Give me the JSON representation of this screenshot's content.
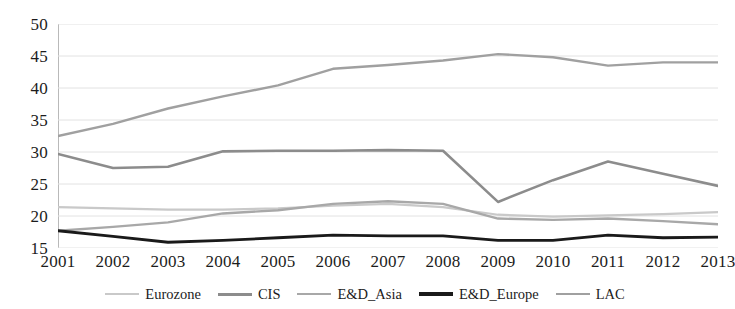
{
  "chart_data": {
    "type": "line",
    "title": "",
    "subtitle": "",
    "xlabel": "",
    "ylabel": "",
    "categories": [
      "2001",
      "2002",
      "2003",
      "2004",
      "2005",
      "2006",
      "2007",
      "2008",
      "2009",
      "2010",
      "2011",
      "2012",
      "2013"
    ],
    "x": [
      2001,
      2002,
      2003,
      2004,
      2005,
      2006,
      2007,
      2008,
      2009,
      2010,
      2011,
      2012,
      2013
    ],
    "ylim": [
      15,
      50
    ],
    "xlim": [
      2001,
      2013
    ],
    "yticks": [
      15,
      20,
      25,
      30,
      35,
      40,
      45,
      50
    ],
    "ytick_labels": [
      "15",
      "20",
      "25",
      "30",
      "35",
      "40",
      "45",
      "50"
    ],
    "grid": true,
    "grid_axis": "y",
    "legend_position": "bottom",
    "series": [
      {
        "name": "Eurozone",
        "color": "#c9c9c9",
        "width": 2.2,
        "values": [
          21.4,
          21.2,
          21.0,
          21.0,
          21.2,
          21.6,
          21.9,
          21.4,
          20.2,
          19.9,
          20.1,
          20.3,
          20.6
        ]
      },
      {
        "name": "CIS",
        "color": "#8c8c8c",
        "width": 2.6,
        "values": [
          29.7,
          27.5,
          27.7,
          30.1,
          30.2,
          30.2,
          30.3,
          30.2,
          22.2,
          25.6,
          28.5,
          26.6,
          24.7
        ]
      },
      {
        "name": "E&D_Asia",
        "color": "#a8a8a8",
        "width": 2.4,
        "values": [
          17.7,
          18.3,
          19.0,
          20.4,
          20.9,
          21.9,
          22.3,
          21.9,
          19.6,
          19.4,
          19.6,
          19.2,
          18.7
        ]
      },
      {
        "name": "E&D_Europe",
        "color": "#1a1a1a",
        "width": 2.8,
        "values": [
          17.7,
          16.8,
          15.9,
          16.2,
          16.6,
          17.0,
          16.9,
          16.9,
          16.2,
          16.2,
          17.0,
          16.6,
          16.7
        ]
      },
      {
        "name": "LAC",
        "color": "#a0a0a0",
        "width": 2.4,
        "values": [
          32.5,
          34.4,
          36.8,
          38.7,
          40.4,
          43.0,
          43.6,
          44.3,
          45.3,
          44.8,
          43.5,
          44.0,
          44.0
        ]
      }
    ]
  },
  "axes": {
    "y_tick_labels": [
      "50",
      "45",
      "40",
      "35",
      "30",
      "25",
      "20",
      "15"
    ],
    "x_tick_labels": [
      "2001",
      "2002",
      "2003",
      "2004",
      "2005",
      "2006",
      "2007",
      "2008",
      "2009",
      "2010",
      "2011",
      "2012",
      "2013"
    ]
  },
  "legend": {
    "items": [
      {
        "label": "Eurozone",
        "color": "#c9c9c9",
        "width": "2px"
      },
      {
        "label": "CIS",
        "color": "#8c8c8c",
        "width": "3px"
      },
      {
        "label": "E&D_Asia",
        "color": "#a8a8a8",
        "width": "2px"
      },
      {
        "label": "E&D_Europe",
        "color": "#1a1a1a",
        "width": "4px"
      },
      {
        "label": "LAC",
        "color": "#a0a0a0",
        "width": "2px"
      }
    ]
  },
  "colors": {
    "background": "#ffffff",
    "gridline": "#e2e2e2",
    "axis": "#b9b9b9",
    "text": "#1c1c1c"
  }
}
